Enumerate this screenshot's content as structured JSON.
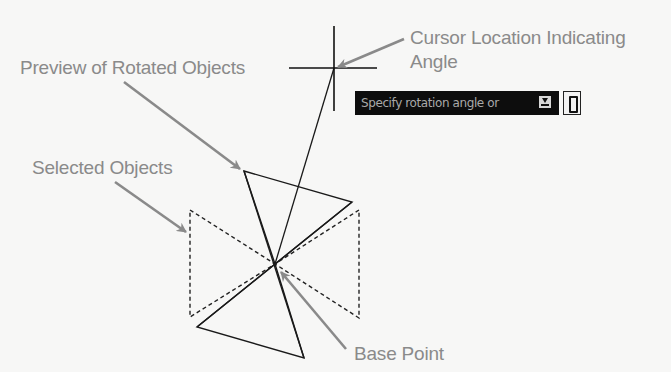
{
  "diagram": {
    "labels": {
      "cursor_line1": "Cursor Location Indicating",
      "cursor_line2": "Angle",
      "preview": "Preview of Rotated Objects",
      "selected": "Selected Objects",
      "base_point": "Base Point"
    },
    "tooltip": {
      "prompt": "Specify rotation angle or",
      "dropdown_icon": "down-arrow-icon",
      "pin_icon": "pin-icon"
    },
    "colors": {
      "annotation": "#8a8a8a",
      "geometry": "#111111",
      "tooltip_bg": "#0d0d0d",
      "tooltip_text": "#a9a9a9"
    }
  }
}
